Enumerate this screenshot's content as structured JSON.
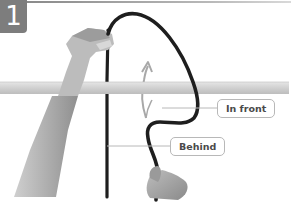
{
  "figure": {
    "step_number": "1",
    "labels": {
      "in_front": "In front",
      "behind": "Behind"
    },
    "elements": [
      "horizontal-pole",
      "rope",
      "left-hand",
      "right-hand",
      "upward-arrow"
    ],
    "colors": {
      "badge": "#7d7d7d",
      "rope": "#1e1e1e",
      "pole": "#cfcfcf",
      "label_border": "#b8b8b8",
      "label_text": "#4a4a4a",
      "arrow": "#a8a8a8"
    }
  }
}
